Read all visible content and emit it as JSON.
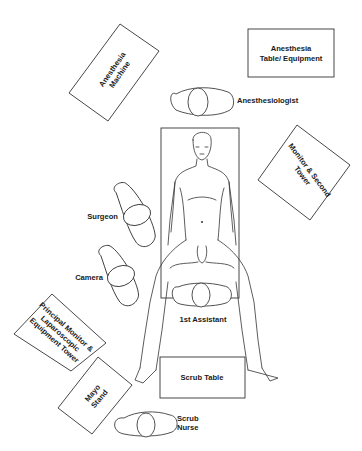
{
  "diagram": {
    "type": "operating-room-setup",
    "equipment": [
      {
        "id": "anesthesia-machine",
        "lines": [
          "Anesthesia",
          "Machine"
        ]
      },
      {
        "id": "anesthesia-table",
        "lines": [
          "Anesthesia",
          "Table/ Equipment"
        ]
      },
      {
        "id": "monitor-second-tower",
        "lines": [
          "Monitor & Second",
          "Tower"
        ]
      },
      {
        "id": "principal-monitor",
        "lines": [
          "Principal Monitor &",
          "Laparoscopic",
          "Equipment Tower"
        ]
      },
      {
        "id": "mayo-stand",
        "lines": [
          "Mayo",
          "Stand"
        ]
      },
      {
        "id": "scrub-table",
        "lines": [
          "Scrub Table"
        ]
      }
    ],
    "personnel": [
      {
        "id": "anesthesiologist",
        "lines": [
          "Anesthesiologist"
        ]
      },
      {
        "id": "surgeon",
        "lines": [
          "Surgeon"
        ]
      },
      {
        "id": "camera",
        "lines": [
          "Camera"
        ]
      },
      {
        "id": "first-assistant",
        "lines": [
          "1st Assistant"
        ]
      },
      {
        "id": "scrub-nurse",
        "lines": [
          "Scrub",
          "Nurse"
        ]
      }
    ],
    "patient": {
      "position": "supine, legs apart (lithotomy-like)"
    },
    "colors": {
      "line": "#333333",
      "text": "#1a1a1a",
      "background": "#ffffff"
    }
  }
}
